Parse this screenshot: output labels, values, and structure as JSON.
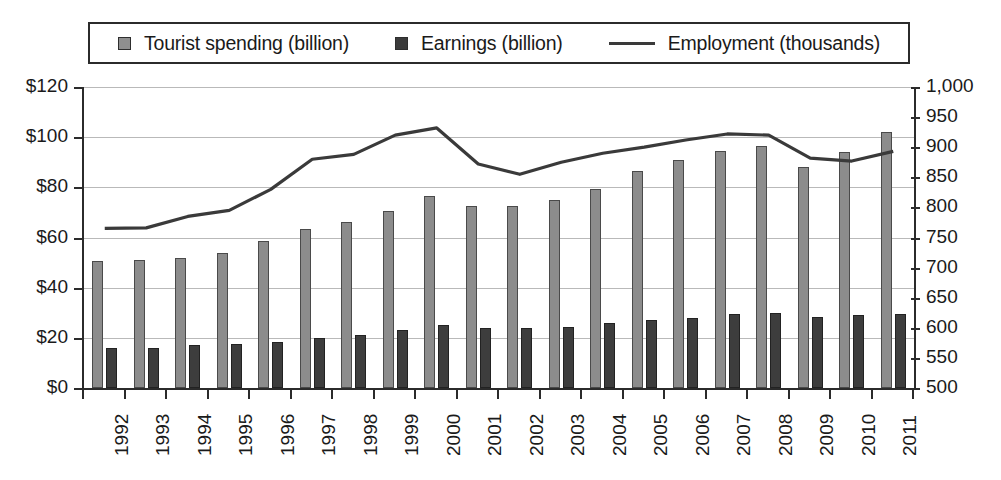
{
  "legend": {
    "items": [
      {
        "label": "Tourist spending (billion)",
        "marker": "square-light-gray",
        "color": "#8c8c8c"
      },
      {
        "label": "Earnings (billion)",
        "marker": "square-dark-gray",
        "color": "#3d3d3d"
      },
      {
        "label": "Employment (thousands)",
        "marker": "line",
        "color": "#3a3a3a"
      }
    ]
  },
  "axes": {
    "left": {
      "ticks": [
        "$0",
        "$20",
        "$40",
        "$60",
        "$80",
        "$100",
        "$120"
      ],
      "min": 0,
      "max": 120,
      "step": 20
    },
    "right": {
      "ticks": [
        "500",
        "550",
        "600",
        "650",
        "700",
        "750",
        "800",
        "850",
        "900",
        "950",
        "1,000"
      ],
      "min": 500,
      "max": 1000,
      "step": 50
    },
    "x": {
      "ticks": [
        "1992",
        "1993",
        "1994",
        "1995",
        "1996",
        "1997",
        "1998",
        "1999",
        "2000",
        "2001",
        "2002",
        "2003",
        "2004",
        "2005",
        "2006",
        "2007",
        "2008",
        "2009",
        "2010",
        "2011"
      ]
    }
  },
  "chart_data": {
    "type": "bar",
    "title": "",
    "xlabel": "",
    "ylabel": "",
    "categories": [
      "1992",
      "1993",
      "1994",
      "1995",
      "1996",
      "1997",
      "1998",
      "1999",
      "2000",
      "2001",
      "2002",
      "2003",
      "2004",
      "2005",
      "2006",
      "2007",
      "2008",
      "2009",
      "2010",
      "2011"
    ],
    "series": [
      {
        "name": "Tourist spending (billion)",
        "type": "bar",
        "axis": "left",
        "color": "#8c8c8c",
        "values": [
          50.5,
          51,
          52,
          54,
          58.5,
          63.5,
          66,
          70.5,
          76.5,
          72.5,
          72.5,
          75,
          79.5,
          86.5,
          91,
          94.5,
          96.5,
          88,
          94,
          102
        ]
      },
      {
        "name": "Earnings (billion)",
        "type": "bar",
        "axis": "left",
        "color": "#3d3d3d",
        "values": [
          16,
          16,
          17,
          17.5,
          18.5,
          20,
          21,
          23,
          25,
          24,
          24,
          24.5,
          26,
          27,
          28,
          29.5,
          30,
          28.5,
          29,
          29.5
        ]
      },
      {
        "name": "Employment (thousands)",
        "type": "line",
        "axis": "right",
        "color": "#3a3a3a",
        "values": [
          765,
          766,
          785,
          795,
          830,
          880,
          888,
          920,
          932,
          872,
          855,
          875,
          890,
          900,
          912,
          922,
          920,
          882,
          877,
          893
        ]
      }
    ],
    "ylim": [
      0,
      120
    ],
    "y2lim": [
      500,
      1000
    ],
    "grid": true,
    "legend_position": "top"
  }
}
